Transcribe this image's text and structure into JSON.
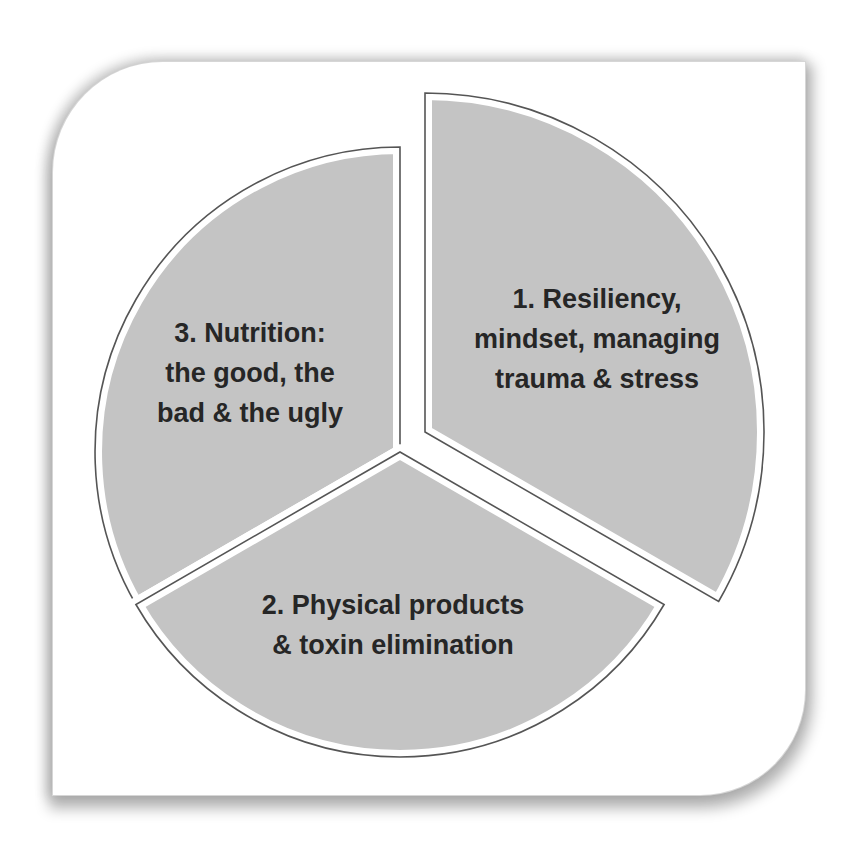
{
  "diagram": {
    "type": "exploded-pie",
    "colors": {
      "slice_fill": "#c4c4c4",
      "slice_outline": "#555555",
      "text": "#262626",
      "card_background": "#ffffff"
    },
    "slices": [
      {
        "number": 1,
        "lines": [
          "1. Resiliency,",
          "mindset, managing",
          "trauma & stress"
        ],
        "exploded": true
      },
      {
        "number": 2,
        "lines": [
          "2. Physical products",
          "& toxin elimination"
        ],
        "exploded": false
      },
      {
        "number": 3,
        "lines": [
          "3. Nutrition:",
          "the good, the",
          "bad & the ugly"
        ],
        "exploded": false
      }
    ]
  }
}
